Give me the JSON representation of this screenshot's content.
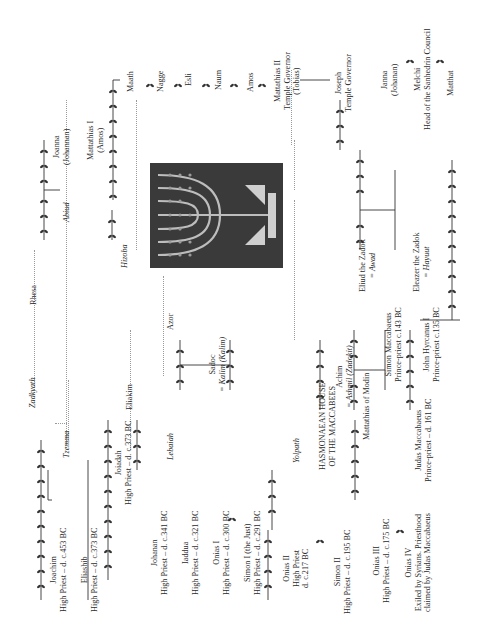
{
  "document": {
    "type": "genealogy-chart",
    "orientation": "rotated-90-ccw",
    "figure": {
      "name": "menorah-mosaic",
      "description": "menorah image"
    }
  },
  "people": {
    "joachim": {
      "name": "Joachim",
      "title": "High Priest – d. c.453 BC"
    },
    "eliashib": {
      "name": "Eliashib",
      "title": "High Priest – d. c.373 BC"
    },
    "joiadah": {
      "name": "Joiadah",
      "title": "High Priest – d. c.373 BC"
    },
    "johanan": {
      "name": "Johanan",
      "title": "High Priest – d. c.341 BC"
    },
    "iaddua": {
      "name": "Iaddua",
      "title": "High Priest – d. c.321 BC"
    },
    "onias1": {
      "name": "Onias I",
      "title": "High Priest – d. c.300 BC"
    },
    "simon1": {
      "name": "Simon I (the Just)",
      "title": "High Priest – d. c.291 BC"
    },
    "onias2": {
      "name": "Onias II",
      "title1": "High Priest",
      "title2": "d. c.217 BC"
    },
    "simon2": {
      "name": "Simon II",
      "title": "High Priest – d. c.195 BC"
    },
    "onias3": {
      "name": "Onias III",
      "title": "High Priest – d. c.175 BC"
    },
    "onias4": {
      "name": "Onias IV",
      "note1": "Exiled by Syrians. Priesthood",
      "note2": "claimed by Judas Maccabaeus"
    },
    "hasmonaean": {
      "line1": "HASMONAEAN HOUSE",
      "line2": "OF THE MACCABEES"
    },
    "mattathias_modin": {
      "name": "Mattathias of Modin"
    },
    "judas": {
      "name": "Judas Maccabaeus",
      "title": "Prince-priest – d. 161 BC"
    },
    "simon_macc": {
      "name": "Simon Maccabaeus",
      "title": "Prince-priest c.143 BC"
    },
    "john_hyrcanus": {
      "name": "John Hyrcanus I",
      "title": "Prince-priest c.135 BC"
    },
    "achim": {
      "name": "Achim",
      "spouse": "= Ashmil (Zadokit)"
    },
    "sadoc": {
      "name": "Sadoc",
      "spouse": "= Kalim (Kalim)"
    },
    "eliud": {
      "name": "Eliud the Zadok",
      "spouse": "= Awad"
    },
    "eleazer": {
      "name": "Eleazer the Zadok",
      "spouse": "= Hayuut"
    },
    "eliakim": {
      "name": "Eliakim"
    },
    "lebaiah": {
      "name": "Lebaiah"
    },
    "azor": {
      "name": "Azor"
    },
    "yolpath": {
      "name": "Yolpath"
    },
    "tzemma": {
      "name": "Tzemma"
    },
    "zadkyath": {
      "name": "Zadkyath"
    },
    "rhesa": {
      "name": "Rhesa"
    },
    "abiud": {
      "name": "Abiud"
    },
    "hizoba": {
      "name": "Hizoba"
    },
    "joanna": {
      "name": "Joanna",
      "alt": "(Johannan)"
    },
    "mattathias1": {
      "name": "Mattathias I",
      "alt": "(Amos)"
    },
    "maath": {
      "name": "Maath"
    },
    "nagge": {
      "name": "Nagge"
    },
    "esli": {
      "name": "Esli"
    },
    "naum": {
      "name": "Naum"
    },
    "amos": {
      "name": "Amos"
    },
    "mattathias2": {
      "name": "Mattathias II",
      "title": "Temple Governor",
      "alt": "(Tobias)"
    },
    "joseph": {
      "name": "Joseph",
      "title": "Temple Governor"
    },
    "janna": {
      "name": "Janna",
      "alt": "(Johanan)"
    },
    "melchi": {
      "name": "Melchi",
      "title": "Head of the Sanhedrin Council"
    },
    "matthat": {
      "name": "Matthat"
    }
  }
}
